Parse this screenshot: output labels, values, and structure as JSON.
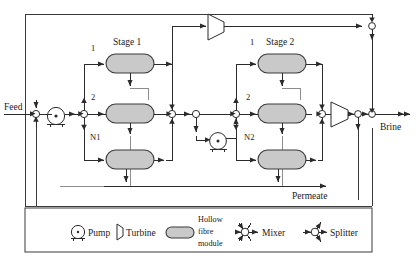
{
  "figure": {
    "kind": "process-flow-diagram"
  },
  "colors": {
    "line": "#2b2b2b",
    "line_dashed": "#6f6f6f",
    "module_fill": "#c9c9c9",
    "module_stroke": "#3a3a3a",
    "node_fill": "#ffffff",
    "background": "#ffffff",
    "text": "#1a1a1a"
  },
  "io_labels": {
    "feed": "Feed",
    "brine": "Brine",
    "permeate": "Permeate"
  },
  "stages": [
    {
      "title": "Stage 1",
      "module_numbers": [
        "1",
        "2"
      ],
      "last_module_label": "N1"
    },
    {
      "title": "Stage 2",
      "module_numbers": [
        "1",
        "2"
      ],
      "last_module_label": "N2"
    }
  ],
  "legend": {
    "items": [
      {
        "icon": "pump-icon",
        "label": "Pump"
      },
      {
        "icon": "turbine-icon",
        "label": "Turbine"
      },
      {
        "icon": "hollow-fibre-module-icon",
        "label": "Hollow fibre module",
        "label_lines": [
          "Hollow",
          "fibre",
          "module"
        ]
      },
      {
        "icon": "mixer-icon",
        "label": "Mixer"
      },
      {
        "icon": "splitter-icon",
        "label": "Splitter"
      }
    ]
  },
  "equipment": {
    "pumps": [
      "feed-pump",
      "interstage-pump"
    ],
    "turbines": [
      "top-turbine",
      "brine-turbine"
    ],
    "modules": [
      "stage1-module-1",
      "stage1-module-2",
      "stage1-module-N1",
      "stage2-module-1",
      "stage2-module-2",
      "stage2-module-N2"
    ]
  }
}
